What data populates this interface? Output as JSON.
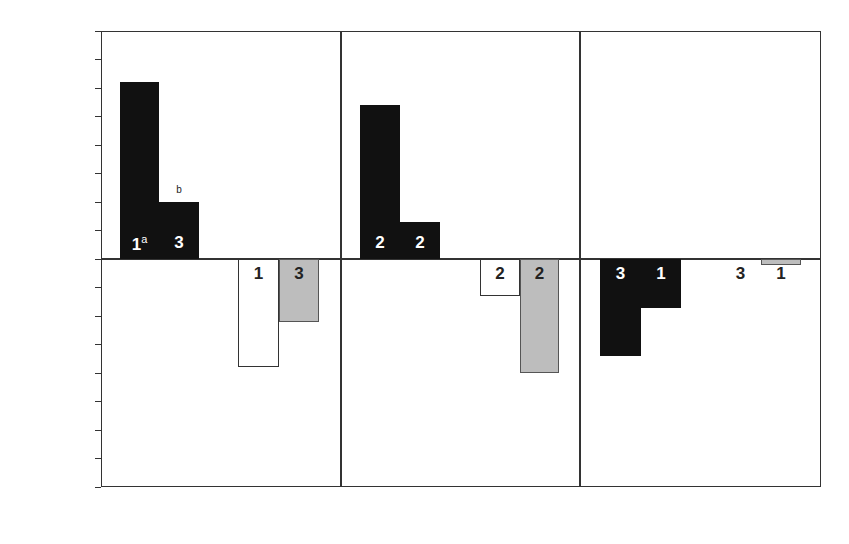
{
  "chart_data": {
    "type": "bar",
    "title": "",
    "ylabel": "Mean Rating",
    "xlabel": "",
    "ylim": [
      -4,
      4
    ],
    "yticks": [
      4,
      3,
      2,
      1,
      0,
      -1,
      -2,
      -3,
      -4
    ],
    "ytick_labels": [
      "4",
      "3",
      "2",
      "1",
      "0",
      "−1",
      "−2",
      "−3",
      "−4"
    ],
    "grid": false,
    "region_labels": {
      "top": "Action",
      "bottom": "Inaction"
    },
    "categories": [
      "Trolley",
      "Button",
      "Person"
    ],
    "panels": [
      {
        "name": "Trolley",
        "action_label": "Action",
        "inaction_label": "Inaction",
        "significance_marker": "*",
        "bars": [
          {
            "group": "action",
            "condition": "1",
            "superscript": "a",
            "value": 3.1,
            "value_label": "3.1",
            "fill": "black"
          },
          {
            "group": "action",
            "condition": "3",
            "superscript": "",
            "value": 1.0,
            "value_label": "1.0",
            "value_superscript": "b",
            "fill": "black"
          },
          {
            "group": "inaction",
            "condition": "1",
            "superscript": "",
            "value": -1.9,
            "value_label": "−1.9",
            "fill": "white"
          },
          {
            "group": "inaction",
            "condition": "3",
            "superscript": "",
            "value": -1.1,
            "value_label": "−1.1",
            "fill": "gray"
          }
        ]
      },
      {
        "name": "Button",
        "action_label": "Action",
        "inaction_label": "Inaction",
        "significance_marker": "*",
        "bars": [
          {
            "group": "action",
            "condition": "2",
            "superscript": "",
            "value": 2.7,
            "value_label": "2.7",
            "fill": "black"
          },
          {
            "group": "action",
            "condition": "2",
            "superscript": "",
            "value": 0.65,
            "value_label": ".65",
            "fill": "black"
          },
          {
            "group": "inaction",
            "condition": "2",
            "superscript": "",
            "value": -0.65,
            "value_label": "−.65",
            "fill": "white"
          },
          {
            "group": "inaction",
            "condition": "2",
            "superscript": "",
            "value": -2.0,
            "value_label": "−2",
            "fill": "gray"
          }
        ]
      },
      {
        "name": "Person",
        "action_label": "Action",
        "inaction_label": "Inaction",
        "significance_marker": "",
        "bars": [
          {
            "group": "action",
            "condition": "3",
            "superscript": "",
            "value": -1.7,
            "value_label": "−1.7",
            "fill": "black"
          },
          {
            "group": "action",
            "condition": "1",
            "superscript": "",
            "value": -0.86,
            "value_label": "−.86",
            "fill": "black"
          },
          {
            "group": "inaction",
            "condition": "3",
            "superscript": "",
            "value": 0,
            "value_label": "0",
            "fill": "white"
          },
          {
            "group": "inaction",
            "condition": "1",
            "superscript": "",
            "value": -0.1,
            "value_label": "−.1",
            "fill": "gray"
          }
        ]
      }
    ],
    "colors": {
      "black": "#111111",
      "white": "#ffffff",
      "gray": "#bdbdbd",
      "axis": "#333333"
    }
  }
}
